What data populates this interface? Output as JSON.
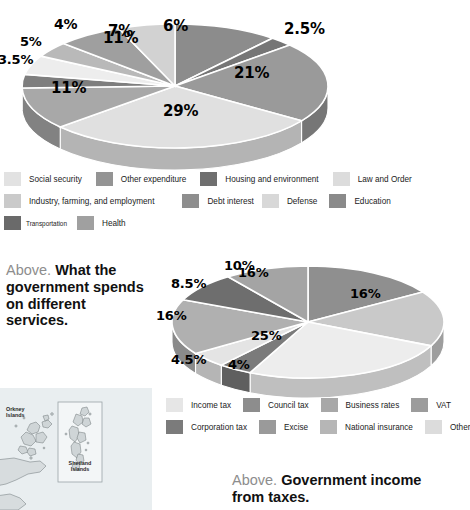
{
  "chart_data": [
    {
      "type": "pie",
      "id": "government-spending",
      "title": "What the government spends on different services",
      "categories": [
        "Social security",
        "Other expenditure",
        "Housing and environment",
        "Law and Order",
        "Industry, farming, and employment",
        "Debt interest",
        "Defense",
        "Education",
        "Transportation",
        "Health"
      ],
      "labels": [
        "29%",
        "11%",
        "3.5%",
        "5%",
        "4%",
        "7%",
        "6%",
        "11%",
        "2.5%",
        "21%"
      ],
      "values": [
        29,
        11,
        3.5,
        5,
        4,
        7,
        6,
        11,
        2.5,
        21
      ],
      "slice_order": [
        "Education 11%",
        "Health 2.5%",
        "Social security 21%",
        "Other expenditure 29%",
        "Housing and environment 11%",
        "Law and Order 3.5%",
        "Industry, farming, and employment 5%",
        "Debt interest 4%",
        "Defense 7%",
        "Transportation 6%"
      ],
      "legend_position": "below",
      "grid": false
    },
    {
      "type": "pie",
      "id": "government-income",
      "title": "Government income from taxes",
      "categories": [
        "Income tax",
        "Council tax",
        "Business rates",
        "VAT",
        "Corporation tax",
        "Excise",
        "National insurance",
        "Other"
      ],
      "labels": [
        "25%",
        "4%",
        "4.5%",
        "16%",
        "8.5%",
        "10%",
        "16%",
        "16%"
      ],
      "values": [
        25,
        4,
        4.5,
        16,
        8.5,
        10,
        16,
        16
      ],
      "legend_position": "below",
      "grid": false
    }
  ],
  "spending_chart": {
    "slices": [
      {
        "name": "Education",
        "label": "11%",
        "value": 11,
        "color": "#8c8c8c",
        "side": "#6d6d6d"
      },
      {
        "name": "Health",
        "label": "2.5%",
        "value": 2.5,
        "color": "#767676",
        "side": "#5a5a5a"
      },
      {
        "name": "Social security",
        "label": "21%",
        "value": 21,
        "color": "#9a9a9a",
        "side": "#767676"
      },
      {
        "name": "Other expenditure",
        "label": "29%",
        "value": 29,
        "color": "#e0e0e0",
        "side": "#b4b4b4"
      },
      {
        "name": "Housing and environment",
        "label": "11%",
        "value": 11,
        "color": "#a8a8a8",
        "side": "#828282"
      },
      {
        "name": "Law and Order",
        "label": "3.5%",
        "value": 3.5,
        "color": "#7e7e7e",
        "side": "#636363"
      },
      {
        "name": "Industry, farming, and employment",
        "label": "5%",
        "value": 5,
        "color": "#ededed",
        "side": "#bdbdbd"
      },
      {
        "name": "Debt interest",
        "label": "4%",
        "value": 4,
        "color": "#b9b9b9",
        "side": "#949494"
      },
      {
        "name": "Defense",
        "label": "7%",
        "value": 7,
        "color": "#9f9f9f",
        "side": "#7b7b7b"
      },
      {
        "name": "Transportation",
        "label": "6%",
        "value": 6,
        "color": "#d2d2d2",
        "side": "#a6a6a6"
      }
    ],
    "legend": [
      [
        {
          "label": "Social security",
          "color": "#e2e2e2"
        },
        {
          "label": "Other expenditure",
          "color": "#949494"
        },
        {
          "label": "Housing and environment",
          "color": "#6f6f6f"
        },
        {
          "label": "Law and Order",
          "color": "#dcdcdc"
        }
      ],
      [
        {
          "label": "Industry, farming, and employment",
          "color": "#cacaca"
        },
        {
          "label": "Debt interest",
          "color": "#8e8e8e"
        },
        {
          "label": "Defense",
          "color": "#d8d8d8"
        },
        {
          "label": "Education",
          "color": "#8a8a8a"
        }
      ],
      [
        {
          "label": "Transportation",
          "color": "#6a6a6a",
          "small": true
        },
        {
          "label": "Health",
          "color": "#a0a0a0"
        }
      ]
    ]
  },
  "income_chart": {
    "slices": [
      {
        "name": "Income tax",
        "label": "16%",
        "value": 16,
        "color": "#8f8f8f",
        "side": "#6e6e6e"
      },
      {
        "name": "Council tax",
        "label": "16%",
        "value": 16,
        "color": "#c9c9c9",
        "side": "#9e9e9e"
      },
      {
        "name": "Business rates",
        "label": "25%",
        "value": 25,
        "color": "#ededed",
        "side": "#bfbfbf"
      },
      {
        "name": "VAT",
        "label": "4%",
        "value": 4,
        "color": "#7b7b7b",
        "side": "#5f5f5f"
      },
      {
        "name": "Corporation tax",
        "label": "4.5%",
        "value": 4.5,
        "color": "#e4e4e4",
        "side": "#b5b5b5"
      },
      {
        "name": "Excise",
        "label": "16%",
        "value": 16,
        "color": "#b0b0b0",
        "side": "#8a8a8a"
      },
      {
        "name": "National insurance",
        "label": "8.5%",
        "value": 8.5,
        "color": "#6e6e6e",
        "side": "#565656"
      },
      {
        "name": "Other",
        "label": "10%",
        "value": 10,
        "color": "#a4a4a4",
        "side": "#808080"
      }
    ],
    "legend": [
      [
        {
          "label": "Income tax",
          "color": "#e6e6e6"
        },
        {
          "label": "Council tax",
          "color": "#8d8d8d"
        },
        {
          "label": "Business rates",
          "color": "#a8a8a8"
        },
        {
          "label": "VAT",
          "color": "#9c9c9c"
        }
      ],
      [
        {
          "label": "Corporation tax",
          "color": "#7b7b7b"
        },
        {
          "label": "Excise",
          "color": "#9a9a9a"
        },
        {
          "label": "National insurance",
          "color": "#b6b6b6"
        },
        {
          "label": "Other",
          "color": "#dcdcdc"
        }
      ]
    ]
  },
  "captions": {
    "spending": {
      "above": "Above.",
      "text_line1": "What the",
      "text_line2": "government spends",
      "text_line3": "on different",
      "text_line4": "services."
    },
    "income": {
      "above": "Above.",
      "text_line1": "Government income",
      "text_line2": "from taxes."
    }
  },
  "map": {
    "orkney_line1": "Orkney",
    "orkney_line2": "Islands",
    "shetland_line1": "Shetland",
    "shetland_line2": "Islands"
  },
  "colors": {
    "caption_above": "#8d8d8d",
    "caption_bold": "#111111",
    "map_sea": "#e9eef0",
    "map_land": "#d7dcde",
    "map_outline": "#7d8789"
  }
}
